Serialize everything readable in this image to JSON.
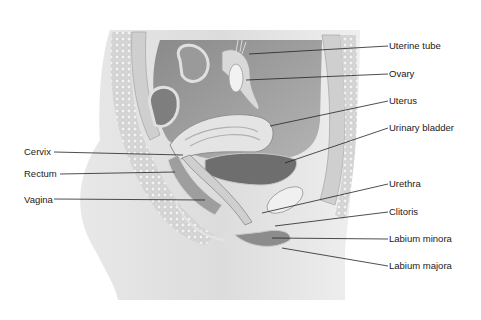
{
  "figure": {
    "style": "grayscale anatomical illustration",
    "labels_right": [
      {
        "text": "Uterine tube",
        "y": 45
      },
      {
        "text": "Ovary",
        "y": 73
      },
      {
        "text": "Uterus",
        "y": 100
      },
      {
        "text": "Urinary bladder",
        "y": 127
      },
      {
        "text": "Urethra",
        "y": 183
      },
      {
        "text": "Clitoris",
        "y": 211
      },
      {
        "text": "Labium minora",
        "y": 238
      },
      {
        "text": "Labium majora",
        "y": 265
      }
    ],
    "labels_left": [
      {
        "text": "Cervix",
        "y": 151
      },
      {
        "text": "Rectum",
        "y": 173
      },
      {
        "text": "Vagina",
        "y": 199
      }
    ]
  }
}
